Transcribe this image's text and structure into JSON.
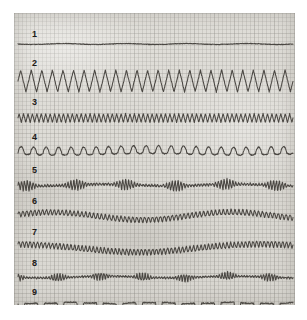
{
  "figure": {
    "panel_background": "#dedcd6",
    "trace_color": "#3e3b36",
    "label_color": "#1d1b18",
    "page_background": "#ffffff"
  },
  "chart_data": {
    "type": "line",
    "title": "",
    "subtitle": "",
    "xlabel": "",
    "ylabel": "",
    "grid": true,
    "legend_position": "none",
    "x": [
      0,
      100
    ],
    "xlim": [
      0,
      100
    ],
    "axis_ticks_visible": false,
    "series": [
      {
        "name": "1",
        "label": "1",
        "waveform": "flat-noise",
        "frequency_cycles": 0,
        "amplitude": 0.6,
        "baseline_y": 31,
        "label_x": 18,
        "label_y": 17,
        "description": "Essentially flat baseline with very small high-frequency noise."
      },
      {
        "name": "2",
        "label": "2",
        "waveform": "triangle",
        "frequency_cycles": 26,
        "amplitude": 11,
        "baseline_y": 68,
        "label_x": 18,
        "label_y": 46,
        "description": "Large-amplitude regular triangular (sawtooth-like) oscillation."
      },
      {
        "name": "3",
        "label": "3",
        "waveform": "triangle",
        "frequency_cycles": 62,
        "amplitude": 4.5,
        "baseline_y": 105,
        "label_x": 18,
        "label_y": 85,
        "description": "High-frequency low-amplitude triangular oscillation, uniform across the strip."
      },
      {
        "name": "4",
        "label": "4",
        "waveform": "rounded-humps",
        "frequency_cycles": 22,
        "amplitude": 6.5,
        "baseline_y": 140,
        "label_x": 18,
        "label_y": 120,
        "description": "Regular rounded upward humps separated by flatter troughs."
      },
      {
        "name": "5",
        "label": "5",
        "waveform": "burst",
        "frequency_cycles": 95,
        "amplitude": 6,
        "baseline_y": 172,
        "label_x": 18,
        "label_y": 153,
        "description": "Intermittent spindle-like bursts of fast oscillation alternating with quiet low-amplitude periods."
      },
      {
        "name": "6",
        "label": "6",
        "waveform": "ripple-drift",
        "frequency_cycles": 70,
        "amplitude": 3,
        "baseline_y": 203,
        "label_x": 18,
        "label_y": 184,
        "description": "Continuous small ripple riding on a slow baseline undulation."
      },
      {
        "name": "7",
        "label": "7",
        "waveform": "ripple-drift",
        "frequency_cycles": 74,
        "amplitude": 3.2,
        "baseline_y": 235,
        "label_x": 18,
        "label_y": 215,
        "description": "Continuous small ripple with a broad slow dip through the middle of the strip."
      },
      {
        "name": "8",
        "label": "8",
        "waveform": "burst",
        "frequency_cycles": 100,
        "amplitude": 4.5,
        "baseline_y": 264,
        "label_x": 18,
        "label_y": 246,
        "description": "Low-amplitude trace with repeated short bursts of faster activity."
      },
      {
        "name": "9",
        "label": "9",
        "waveform": "downward-notches",
        "frequency_cycles": 14,
        "amplitude": 9,
        "baseline_y": 290,
        "label_x": 18,
        "label_y": 275,
        "description": "Wavy baseline interrupted by regular sharp downward V-shaped notches."
      }
    ]
  }
}
